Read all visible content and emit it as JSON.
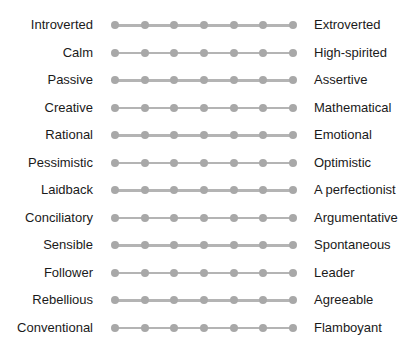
{
  "scale": {
    "points": 7,
    "line_color": "#b4b4b4",
    "dot_color": "#a8a8a8"
  },
  "rows": [
    {
      "left": "Introverted",
      "right": "Extroverted"
    },
    {
      "left": "Calm",
      "right": "High-spirited"
    },
    {
      "left": "Passive",
      "right": "Assertive"
    },
    {
      "left": "Creative",
      "right": "Mathematical"
    },
    {
      "left": "Rational",
      "right": "Emotional"
    },
    {
      "left": "Pessimistic",
      "right": "Optimistic"
    },
    {
      "left": "Laidback",
      "right": "A perfectionist"
    },
    {
      "left": "Conciliatory",
      "right": "Argumentative"
    },
    {
      "left": "Sensible",
      "right": "Spontaneous"
    },
    {
      "left": "Follower",
      "right": "Leader"
    },
    {
      "left": "Rebellious",
      "right": "Agreeable"
    },
    {
      "left": "Conventional",
      "right": "Flamboyant"
    }
  ]
}
